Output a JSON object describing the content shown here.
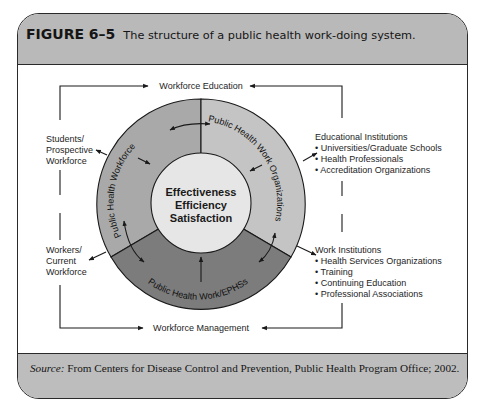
{
  "figure": {
    "number": "FIGURE 6–5",
    "caption": "The structure of a public health work-doing system."
  },
  "diagram": {
    "top_flow": "Workforce Education",
    "bottom_flow": "Workforce Management",
    "left_top": [
      "Students/",
      "Prospective",
      "Workforce"
    ],
    "left_bottom": [
      "Workers/",
      "Current",
      "Workforce"
    ],
    "right_top": {
      "title": "Educational Institutions",
      "items": [
        "Universities/Graduate Schools",
        "Health Professionals",
        "Accreditation Organizations"
      ]
    },
    "right_bottom": {
      "title": "Work Institutions",
      "items": [
        "Health Services Organizations",
        "Training",
        "Continuing Education",
        "Professional Associations"
      ]
    },
    "core": [
      "Effectiveness",
      "Efficiency",
      "Satisfaction"
    ],
    "ring_segments": {
      "workforce": "Public Health Workforce",
      "organizations": "Public Health Work Organizations",
      "work": "Public Health Work/EPHSs"
    },
    "colors": {
      "segment_workforce": "#a9a9a9",
      "segment_organizations": "#c4c4c4",
      "segment_work": "#7c7c7c",
      "core": "#e6e6e6",
      "band": "#b9b9b9"
    }
  },
  "footer": {
    "source_label": "Source:",
    "source_text": " From Centers for Disease Control and Prevention, Public Health Program Office; 2002."
  }
}
